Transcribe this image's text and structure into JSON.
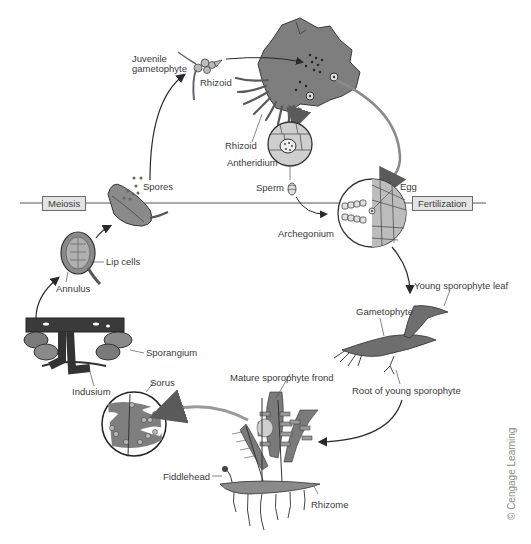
{
  "diagram": {
    "phase_boxes": {
      "meiosis": "Meiosis",
      "fertilization": "Fertilization"
    },
    "labels": {
      "juvenile_gametophyte": "Juvenile\ngametophyte",
      "rhizoid_juvenile": "Rhizoid",
      "rhizoid_gametophyte": "Rhizoid",
      "antheridium": "Antheridium",
      "sperm": "Sperm",
      "egg": "Egg",
      "archegonium": "Archegonium",
      "spores": "Spores",
      "lip_cells": "Lip cells",
      "annulus": "Annulus",
      "sporangium": "Sporangium",
      "indusium": "Indusium",
      "sorus": "Sorus",
      "young_sporophyte_leaf": "Young sporophyte leaf",
      "gametophyte": "Gametophyte",
      "root_of_young_sporophyte": "Root of young sporophyte",
      "mature_sporophyte_frond": "Mature sporophyte frond",
      "fiddlehead": "Fiddlehead",
      "rhizome": "Rhizome"
    },
    "credit": "© Cengage Learning",
    "colors": {
      "line": "#3a3a3a",
      "plant_fill": "#7a7a7a",
      "box_fill": "#e4e4e4",
      "label_text": "#3a3a3a"
    }
  }
}
